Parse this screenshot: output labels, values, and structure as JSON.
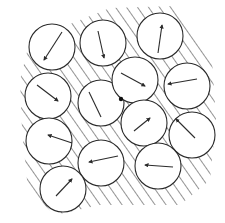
{
  "diagram": {
    "colors": {
      "stroke": "#2b2b2b",
      "hatch": "#3a3a3a",
      "fill": "#ffffff",
      "background": "#ffffff"
    },
    "radius": 23,
    "boundary": "M30,40 L110,8 L175,6 L212,60 L216,120 L210,180 L180,205 L100,205 L55,215 L28,190 L22,130 L20,80 Z",
    "disks": [
      {
        "id": 1,
        "cx": 52,
        "cy": 47,
        "tail": [
          62,
          32
        ],
        "head": [
          44,
          60
        ]
      },
      {
        "id": 2,
        "cx": 103,
        "cy": 43,
        "tail": [
          98,
          31
        ],
        "head": [
          104,
          58
        ]
      },
      {
        "id": 3,
        "cx": 160,
        "cy": 36,
        "tail": [
          158,
          53
        ],
        "head": [
          162,
          25
        ]
      },
      {
        "id": 4,
        "cx": 48,
        "cy": 96,
        "tail": [
          37,
          85
        ],
        "head": [
          58,
          101
        ]
      },
      {
        "id": 5,
        "cx": 101,
        "cy": 103,
        "tail": [
          89,
          92
        ],
        "head": [
          101,
          117
        ],
        "no_head": true
      },
      {
        "id": 6,
        "cx": 135,
        "cy": 80,
        "tail": [
          121,
          73
        ],
        "head": [
          145,
          86
        ]
      },
      {
        "id": 7,
        "cx": 187,
        "cy": 86,
        "tail": [
          197,
          79
        ],
        "head": [
          168,
          84
        ]
      },
      {
        "id": 8,
        "cx": 49,
        "cy": 141,
        "tail": [
          72,
          143
        ],
        "head": [
          48,
          135
        ]
      },
      {
        "id": 9,
        "cx": 144,
        "cy": 123,
        "tail": [
          134,
          131
        ],
        "head": [
          150,
          118
        ]
      },
      {
        "id": 10,
        "cx": 192,
        "cy": 135,
        "tail": [
          195,
          138
        ],
        "head": [
          176,
          119
        ]
      },
      {
        "id": 11,
        "cx": 101,
        "cy": 163,
        "tail": [
          118,
          156
        ],
        "head": [
          89,
          162
        ]
      },
      {
        "id": 12,
        "cx": 158,
        "cy": 166,
        "tail": [
          173,
          167
        ],
        "head": [
          145,
          165
        ]
      },
      {
        "id": 13,
        "cx": 63,
        "cy": 189,
        "tail": [
          56,
          196
        ],
        "head": [
          72,
          179
        ]
      }
    ],
    "marker": {
      "label": "contact-dot",
      "cx": 121,
      "cy": 99,
      "r": 2.2
    }
  }
}
